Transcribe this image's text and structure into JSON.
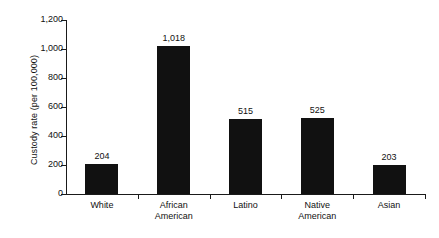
{
  "chart_data": {
    "type": "bar",
    "title": "",
    "subtitle": "",
    "xlabel": "",
    "ylabel": "Custody rate (per 100,000)",
    "categories": [
      "White",
      "African\nAmerican",
      "Latino",
      "Native\nAmerican",
      "Asian"
    ],
    "values": [
      204,
      1018,
      515,
      525,
      203
    ],
    "value_labels": [
      "204",
      "1,018",
      "515",
      "525",
      "203"
    ],
    "ylim": [
      0,
      1200
    ],
    "yticks": [
      0,
      200,
      400,
      600,
      800,
      1000,
      1200
    ],
    "ytick_labels": [
      "0",
      "200",
      "400",
      "600",
      "800",
      "1,000",
      "1,200"
    ],
    "grid": false,
    "legend": null,
    "bar_color": "#111111",
    "axis_color": "#1a1a1a",
    "background": "#ffffff"
  }
}
